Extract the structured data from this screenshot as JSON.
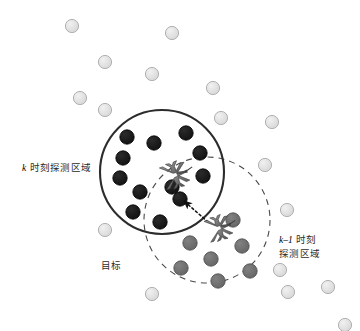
{
  "figure": {
    "background_color": "#ffffff",
    "width": 360,
    "height": 331
  },
  "labels": {
    "k_region": {
      "text": "k 时刻探测区域",
      "prefix_italic": "k",
      "rest": " 时刻探测区域",
      "x": 22,
      "y": 159
    },
    "k_minus_1_region": {
      "line1_italic": "k–1",
      "line1_rest": " 时刻",
      "line2": "探测区域",
      "x": 279,
      "y": 231
    },
    "target": {
      "text": "目标",
      "x": 101,
      "y": 258
    }
  },
  "regions": [
    {
      "name": "k-detection-region",
      "style": "solid",
      "cx": 162,
      "cy": 172,
      "r": 62,
      "stroke": "#2c2c2c",
      "stroke_width": 2.1
    },
    {
      "name": "k-minus-1-detection-region",
      "style": "dashed",
      "cx": 207,
      "cy": 220,
      "r": 63,
      "stroke": "#4a4a4a",
      "stroke_width": 1.1,
      "dash": "6 5"
    }
  ],
  "colors": {
    "dark_dot": "#1c1c1c",
    "dark_dot_stroke": "#000000",
    "mid_dot": "#6d6d6d",
    "mid_dot_stroke": "#4a4a4a",
    "light_dot": "#dcdcdc",
    "light_dot_stroke": "#a9a9a9",
    "aircraft": "#7a7a7a",
    "aircraft_stroke": "#3a3a3a",
    "arrow": "#111111"
  },
  "dots": {
    "dark": {
      "legend": "detections at time k (inside solid circle)",
      "radius": 7.2,
      "points": [
        [
          127,
          137
        ],
        [
          154,
          143
        ],
        [
          186,
          133
        ],
        [
          123,
          158
        ],
        [
          120,
          178
        ],
        [
          200,
          153
        ],
        [
          140,
          192
        ],
        [
          203,
          176
        ],
        [
          172,
          187
        ],
        [
          133,
          212
        ],
        [
          160,
          222
        ],
        [
          180,
          199
        ]
      ]
    },
    "mid": {
      "legend": "detections at time k-1 (inside dashed circle)",
      "radius": 7.2,
      "points": [
        [
          233,
          220
        ],
        [
          190,
          243
        ],
        [
          242,
          246
        ],
        [
          211,
          259
        ],
        [
          181,
          268
        ],
        [
          218,
          281
        ],
        [
          250,
          271
        ]
      ]
    },
    "light": {
      "legend": "clutter / background points outside detection regions",
      "radius": 6.6,
      "points": [
        [
          72,
          26
        ],
        [
          172,
          33
        ],
        [
          105,
          62
        ],
        [
          152,
          74
        ],
        [
          80,
          98
        ],
        [
          105,
          110
        ],
        [
          213,
          88
        ],
        [
          221,
          118
        ],
        [
          272,
          122
        ],
        [
          105,
          230
        ],
        [
          152,
          294
        ],
        [
          265,
          165
        ],
        [
          287,
          210
        ],
        [
          280,
          270
        ],
        [
          288,
          292
        ],
        [
          328,
          287
        ],
        [
          345,
          325
        ]
      ]
    }
  },
  "aircraft": [
    {
      "name": "aircraft-time-k",
      "x": 172,
      "y": 176,
      "rotation": -18,
      "scale": 1.0
    },
    {
      "name": "aircraft-time-k-minus-1",
      "x": 216,
      "y": 229,
      "rotation": -18,
      "scale": 0.95
    }
  ],
  "arrow": {
    "name": "motion-arrow",
    "style": "dotted",
    "from": [
      208,
      222
    ],
    "to": [
      184,
      201
    ],
    "description": "dotted arrow from time k-1 aircraft position toward time k detection"
  }
}
